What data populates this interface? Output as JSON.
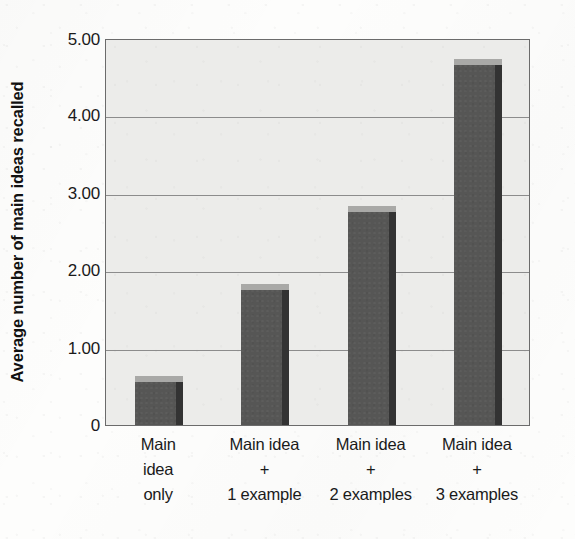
{
  "chart_data": {
    "type": "bar",
    "title": "",
    "subtitle": "",
    "xlabel": "",
    "ylabel": "Average number of main ideas recalled",
    "categories": [
      "Main idea only",
      "Main idea + 1 example",
      "Main idea + 2 examples",
      "Main idea + 3 examples"
    ],
    "category_lines": [
      [
        "Main",
        "idea",
        "only"
      ],
      [
        "Main idea",
        "+",
        "1 example"
      ],
      [
        "Main idea",
        "+",
        "2 examples"
      ],
      [
        "Main idea",
        "+",
        "3 examples"
      ]
    ],
    "values": [
      0.63,
      1.82,
      2.83,
      4.73
    ],
    "ylim": [
      0,
      5
    ],
    "ytick_labels": [
      "0",
      "1.00",
      "2.00",
      "3.00",
      "4.00",
      "5.00"
    ],
    "ytick_values": [
      0,
      1,
      2,
      3,
      4,
      5
    ],
    "grid": true,
    "gridlines_at": [
      1,
      2,
      3,
      4
    ],
    "legend": null,
    "legend_position": "none",
    "colors": {
      "bar_front": "#565655",
      "bar_top": "#a9a9a7",
      "bar_side": "#333333",
      "plot_background": "#ececea",
      "gridline": "#8c8c8c",
      "axis": "#6b6b6b",
      "text": "#1a1a1a"
    }
  },
  "axis": {
    "y_title": "Average number of main ideas recalled"
  }
}
